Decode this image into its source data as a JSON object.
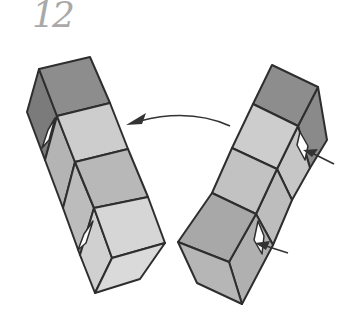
{
  "step": {
    "number": "12"
  },
  "diagram": {
    "colors": {
      "stroke": "#2e2e2e",
      "top_dark": "#8d8d8d",
      "side_dark": "#7b7b7b",
      "face_mid": "#b4b4b4",
      "face_light": "#cdcdcd",
      "face_lighter": "#dadada",
      "pocket": "#ffffff",
      "arrow": "#333333"
    },
    "arrows": [
      {
        "name": "curved-rotate-arrow",
        "from": [
          230,
          126
        ],
        "to": [
          126,
          125
        ]
      },
      {
        "name": "insert-arrow-upper",
        "from": [
          334,
          164
        ],
        "to": [
          304,
          150
        ]
      },
      {
        "name": "insert-arrow-lower",
        "from": [
          288,
          253
        ],
        "to": [
          256,
          243
        ]
      }
    ]
  }
}
